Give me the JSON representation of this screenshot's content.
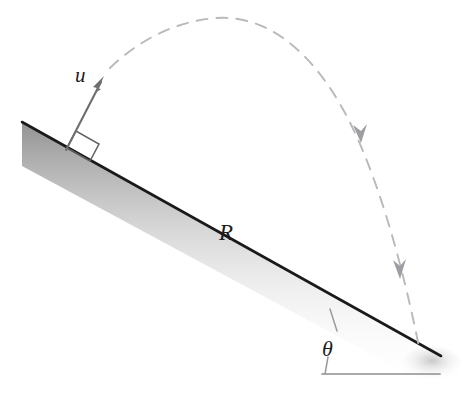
{
  "figure": {
    "background_color": "#ffffff",
    "width": 473,
    "height": 404,
    "labels": {
      "velocity": "u",
      "range": "R",
      "angle": "θ"
    },
    "colors": {
      "incline_edge": "#1a1a1a",
      "incline_shadow": "#b6b6b6",
      "trajectory": "#b9b9bd",
      "vector": "#6e6e72",
      "angle_guide": "#9a9a9e",
      "label_text": "#1c1c1c"
    },
    "elements": [
      {
        "name": "incline-surface",
        "kind": "line-with-shadow",
        "description": "Inclined plane descending left to right",
        "start": [
          22,
          122
        ],
        "end": [
          441,
          356
        ]
      },
      {
        "name": "velocity-vector",
        "kind": "arrow",
        "description": "Initial velocity u, perpendicular to the incline",
        "tail": [
          67,
          148
        ],
        "tip": [
          104,
          77
        ],
        "label": "u"
      },
      {
        "name": "right-angle-marker",
        "kind": "square",
        "description": "Right angle between velocity vector and incline surface",
        "corner": [
          67,
          148
        ]
      },
      {
        "name": "trajectory",
        "kind": "dashed-curve",
        "description": "Parabolic projectile path from launch to landing on the incline",
        "launch": [
          110,
          68
        ],
        "apex": [
          216,
          18
        ],
        "landing": [
          419,
          347
        ]
      },
      {
        "name": "trajectory-arrowhead-upper",
        "kind": "arrowhead",
        "at": [
          361,
          134
        ]
      },
      {
        "name": "trajectory-arrowhead-lower",
        "kind": "arrowhead",
        "at": [
          399,
          269
        ]
      },
      {
        "name": "range-label",
        "kind": "text",
        "at": [
          228,
          232
        ],
        "label": "R"
      },
      {
        "name": "horizontal-reference-line",
        "kind": "line",
        "start": [
          322,
          374
        ],
        "end": [
          440,
          374
        ]
      },
      {
        "name": "angle-arc",
        "kind": "arc",
        "description": "Arc marking the incline angle theta at the base",
        "vertex": [
          440,
          356
        ]
      },
      {
        "name": "angle-label",
        "kind": "text",
        "at": [
          330,
          349
        ],
        "label": "θ"
      }
    ]
  }
}
